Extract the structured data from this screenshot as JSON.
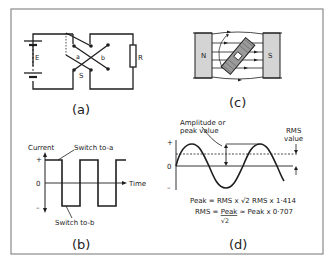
{
  "figure": {
    "colors": {
      "ink": "#1e1e1e",
      "frame": "#8a8a8a",
      "magnet_fill": "#d4d4d4",
      "coil_fill": "#9a9a9a",
      "background": "#ffffff"
    },
    "panel_a": {
      "caption": "(a)",
      "battery_label": "E",
      "resistor_label": "R",
      "switch_label": "S",
      "contact_a_label": "a",
      "contact_b_label": "b"
    },
    "panel_b": {
      "caption": "(b)",
      "y_axis_label": "Current",
      "x_axis_label": "Time",
      "plus_label": "+",
      "zero_label": "0",
      "minus_label": "–",
      "annotation_top": "Switch to-a",
      "annotation_bottom": "Switch to-b"
    },
    "panel_c": {
      "caption": "(c)",
      "north_label": "N",
      "south_label": "S"
    },
    "panel_d": {
      "caption": "(d)",
      "amplitude_label_line1": "Amplitude or",
      "amplitude_label_line2": "peak value",
      "rms_label_line1": "RMS",
      "rms_label_line2": "value",
      "plus_label": "+",
      "zero_label": "0",
      "minus_label": "–",
      "formula_line1": "Peak = RMS x √2  RMS x 1·414",
      "formula_line2_lhs": "RMS = ",
      "formula_line2_num": "Peak",
      "formula_line2_rhs": " ≃ Peak x 0·707",
      "formula_line2_den": "√2"
    }
  }
}
